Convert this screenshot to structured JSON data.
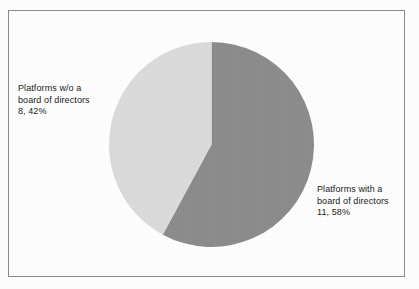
{
  "figure": {
    "background_color": "#ffffff",
    "border_color": "#8c8c8c"
  },
  "chart_data": {
    "type": "pie",
    "title": "",
    "subtitle": "",
    "xlabel": "",
    "ylabel": "",
    "legend_position": "none",
    "grid": false,
    "total": 19,
    "start_angle_deg": 0,
    "direction": "clockwise",
    "categories": [
      "Platforms with a board of directors",
      "Platforms w/o a board of directors"
    ],
    "values": [
      11,
      8
    ],
    "percentages": [
      58,
      42
    ],
    "colors": [
      "#8d8d8d",
      "#dcdcdc"
    ],
    "slices": [
      {
        "name": "Platforms with a board of directors",
        "value": 11,
        "percent": 58,
        "color": "#8d8d8d",
        "label_line1": "Platforms with a",
        "label_line2": "board of directors",
        "label_line3": "11, 58%"
      },
      {
        "name": "Platforms w/o a board of directors",
        "value": 8,
        "percent": 42,
        "color": "#dcdcdc",
        "label_line1": "Platforms w/o a",
        "label_line2": "board of directors",
        "label_line3": "8, 42%"
      }
    ]
  },
  "labels": {
    "left": "Platforms w/o a\nboard of directors\n8, 42%",
    "right": "Platforms with a\nboard of directors\n11, 58%"
  }
}
